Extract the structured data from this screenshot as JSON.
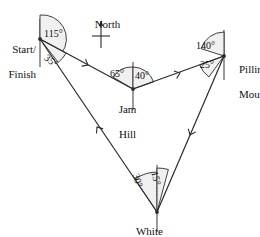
{
  "figure": {
    "stroke_color": "#2b2b2b",
    "arc_fill": "#f0f0f0",
    "background": "#ffffff"
  },
  "compass": {
    "label": "North",
    "icon": "north-arrow-icon"
  },
  "stations": [
    {
      "id": "start-finish",
      "label_line1": "Start/",
      "label_line2": "Finish",
      "x": 40,
      "y": 39
    },
    {
      "id": "jam-hill",
      "label_line1": "Jam",
      "label_line2": "Hill",
      "x": 133,
      "y": 89
    },
    {
      "id": "pilling-mount",
      "label_line1": "Pilling",
      "label_line2": "Mount",
      "x": 224,
      "y": 56
    },
    {
      "id": "white-swan",
      "label_line1": "White",
      "label_line2": "Swan",
      "x": 157,
      "y": 212
    }
  ],
  "angles": [
    {
      "id": "start-finish-115",
      "station": "start-finish",
      "value": "115°",
      "x": 49,
      "y": 31,
      "rotate": 0
    },
    {
      "id": "start-finish-35",
      "station": "start-finish",
      "value": "35°",
      "x": 52,
      "y": 55,
      "rotate": 38
    },
    {
      "id": "jam-hill-65",
      "station": "jam-hill",
      "value": "65°",
      "x": 112,
      "y": 69,
      "rotate": 0
    },
    {
      "id": "jam-hill-40",
      "station": "jam-hill",
      "value": "40°",
      "x": 136,
      "y": 71,
      "rotate": 0
    },
    {
      "id": "pilling-mount-140",
      "station": "pilling-mount",
      "value": "140°",
      "x": 197,
      "y": 43,
      "rotate": 0
    },
    {
      "id": "pilling-mount-25",
      "station": "pilling-mount",
      "value": "25°",
      "x": 201,
      "y": 62,
      "rotate": 0
    },
    {
      "id": "white-swan-30",
      "station": "white-swan",
      "value": "30°",
      "x": 139,
      "y": 176,
      "rotate": 72
    },
    {
      "id": "white-swan-15",
      "station": "white-swan",
      "value": "15°",
      "x": 159,
      "y": 173,
      "rotate": 78
    }
  ],
  "legs": [
    {
      "id": "leg-start-to-jam",
      "from": "start-finish",
      "to": "jam-hill",
      "direction_marker": "arrow-forward"
    },
    {
      "id": "leg-jam-to-pilling",
      "from": "jam-hill",
      "to": "pilling-mount",
      "direction_marker": "arrow-forward"
    },
    {
      "id": "leg-pilling-to-swan",
      "from": "pilling-mount",
      "to": "white-swan",
      "direction_marker": "arrow-forward"
    },
    {
      "id": "leg-swan-to-start",
      "from": "white-swan",
      "to": "start-finish",
      "direction_marker": "arrow-forward"
    }
  ]
}
